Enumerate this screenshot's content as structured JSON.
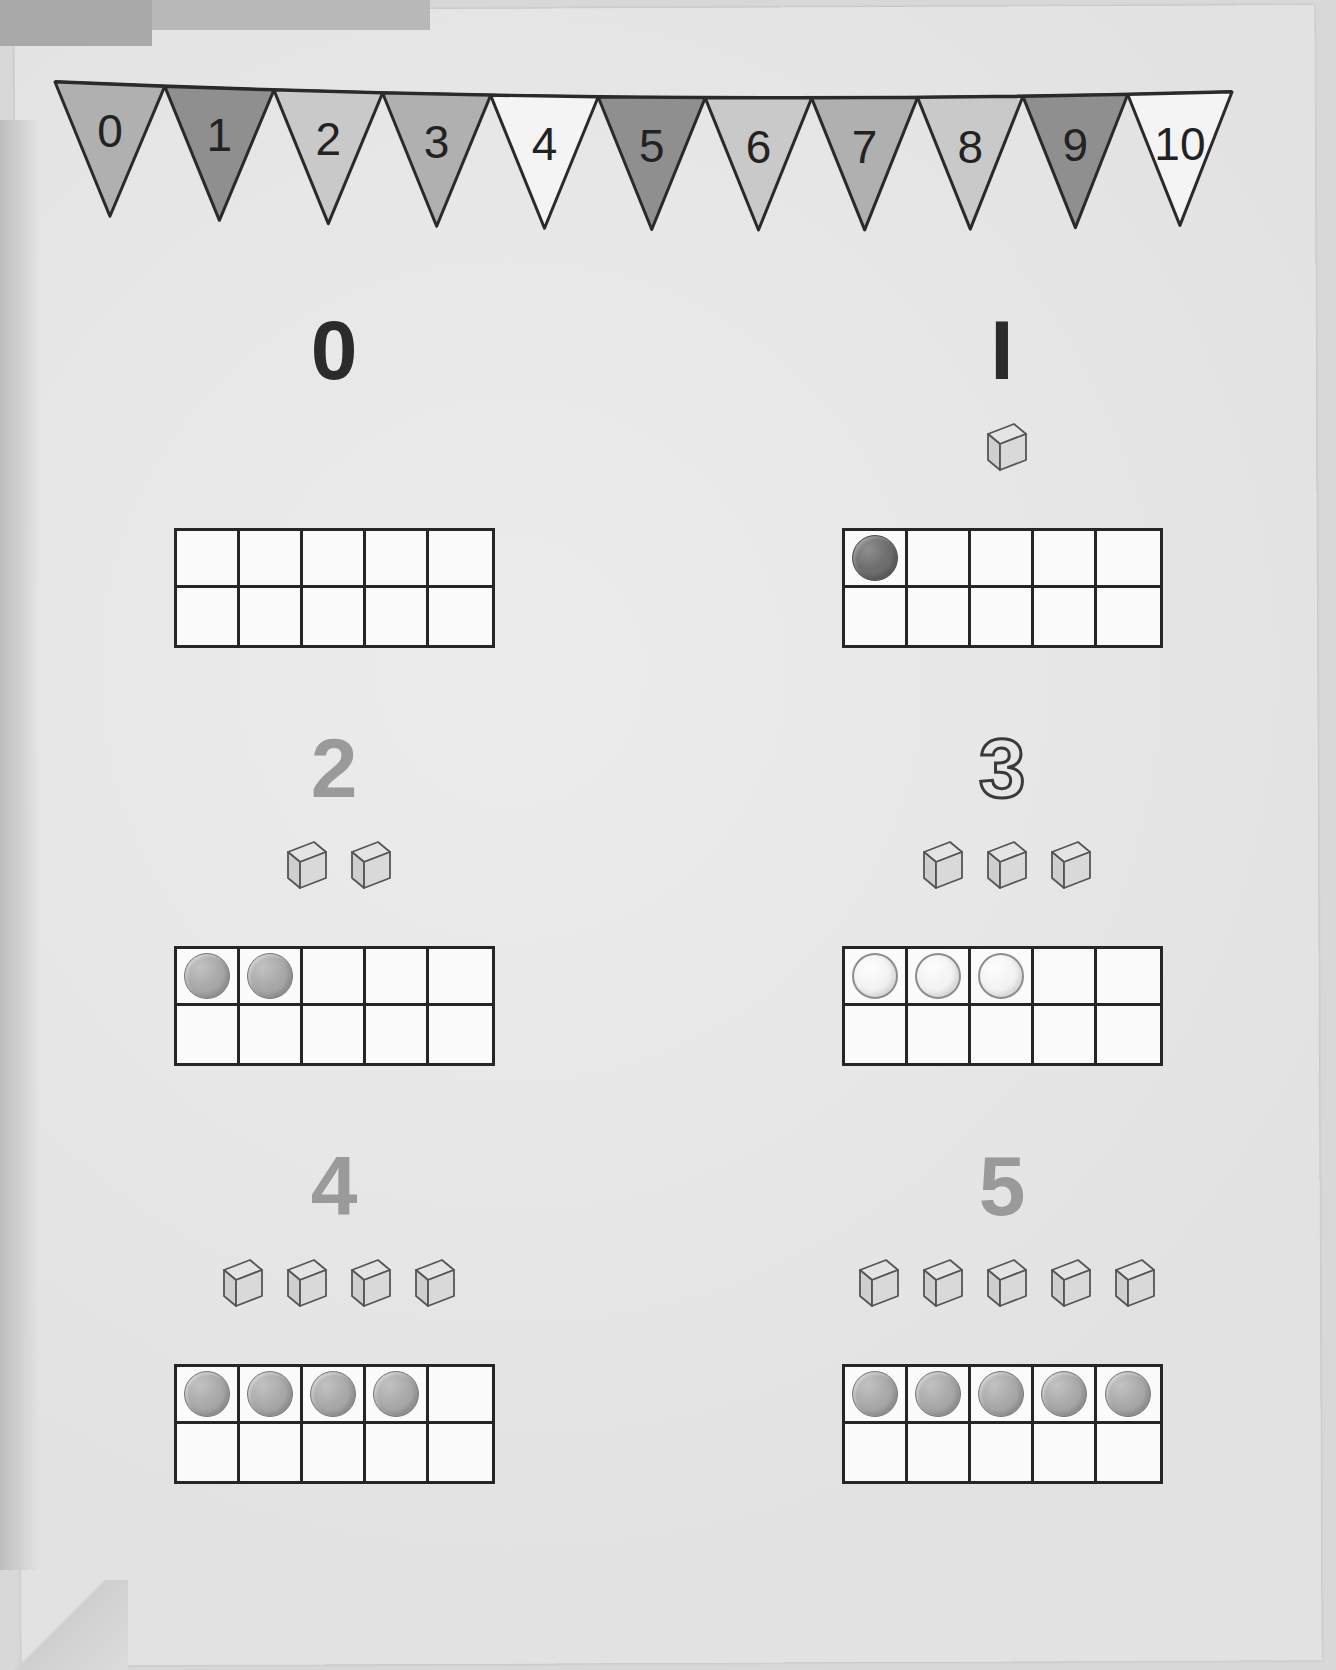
{
  "banner": {
    "name": "number-bunting",
    "pennants": [
      {
        "label": "0",
        "fill": "medium"
      },
      {
        "label": "1",
        "fill": "dark"
      },
      {
        "label": "2",
        "fill": "light"
      },
      {
        "label": "3",
        "fill": "medium"
      },
      {
        "label": "4",
        "fill": "white"
      },
      {
        "label": "5",
        "fill": "dark"
      },
      {
        "label": "6",
        "fill": "light"
      },
      {
        "label": "7",
        "fill": "medium"
      },
      {
        "label": "8",
        "fill": "light"
      },
      {
        "label": "9",
        "fill": "dark"
      },
      {
        "label": "10",
        "fill": "white"
      }
    ]
  },
  "colors": {
    "pennant_light": "#c9c9c9",
    "pennant_medium": "#b0b0b0",
    "pennant_dark": "#8f8f8f",
    "pennant_white": "#f4f4f4",
    "pennant_outline": "#2a2a2a",
    "numeral_dark": "#2b2b2b",
    "numeral_gray": "#9a9a9a",
    "frame_border": "#262626",
    "counter_dark": "#6f6f6f",
    "counter_mid": "#a8a8a8",
    "counter_light": "#f2f2f2",
    "cube_face": "#d6d6d6",
    "paper": "#e7e7e7"
  },
  "groups": [
    {
      "numeral": "0",
      "numeral_style": "dark",
      "cubes": 0,
      "counters": 0,
      "counter_style": "dark"
    },
    {
      "numeral": "I",
      "numeral_style": "dark",
      "cubes": 1,
      "counters": 1,
      "counter_style": "dark"
    },
    {
      "numeral": "2",
      "numeral_style": "gray",
      "cubes": 2,
      "counters": 2,
      "counter_style": "mid"
    },
    {
      "numeral": "3",
      "numeral_style": "hollow",
      "cubes": 3,
      "counters": 3,
      "counter_style": "light"
    },
    {
      "numeral": "4",
      "numeral_style": "gray",
      "cubes": 4,
      "counters": 4,
      "counter_style": "mid"
    },
    {
      "numeral": "5",
      "numeral_style": "gray",
      "cubes": 5,
      "counters": 5,
      "counter_style": "mid"
    }
  ],
  "tenframe": {
    "name": "ten-frame",
    "columns": 5,
    "rows": 2,
    "total_cells": 10
  }
}
